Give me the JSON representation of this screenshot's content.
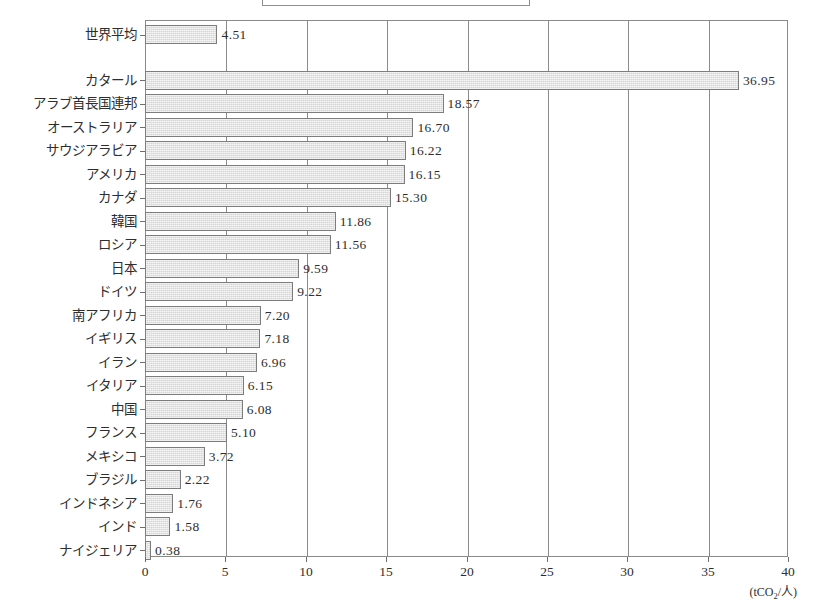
{
  "title_box": {
    "text": ""
  },
  "axis": {
    "unit_label_prefix": "(tCO",
    "unit_label_sub": "2",
    "unit_label_suffix": "/人)",
    "ticks": [
      "0",
      "5",
      "10",
      "15",
      "20",
      "25",
      "30",
      "35",
      "40"
    ]
  },
  "colors": {
    "bar_fill": "#d6d6d6",
    "bar_border": "#7d7d7d",
    "frame": "#8a8a8a",
    "text": "#2e2e2e",
    "background": "#ffffff"
  },
  "chart_data": {
    "type": "bar",
    "orientation": "horizontal",
    "title": "",
    "xlabel": "(tCO2/人)",
    "ylabel": "",
    "xlim": [
      0,
      40
    ],
    "xticks": [
      0,
      5,
      10,
      15,
      20,
      25,
      30,
      35,
      40
    ],
    "grid": true,
    "legend": "none",
    "categories": [
      "世界平均",
      "カタール",
      "アラブ首長国連邦",
      "オーストラリア",
      "サウジアラビア",
      "アメリカ",
      "カナダ",
      "韓国",
      "ロシア",
      "日本",
      "ドイツ",
      "南アフリカ",
      "イギリス",
      "イラン",
      "イタリア",
      "中国",
      "フランス",
      "メキシコ",
      "ブラジル",
      "インドネシア",
      "インド",
      "ナイジェリア"
    ],
    "values": [
      4.51,
      36.95,
      18.57,
      16.7,
      16.22,
      16.15,
      15.3,
      11.86,
      11.56,
      9.59,
      9.22,
      7.2,
      7.18,
      6.96,
      6.15,
      6.08,
      5.1,
      3.72,
      2.22,
      1.76,
      1.58,
      0.38
    ],
    "value_labels": [
      "4.51",
      "36.95",
      "18.57",
      "16.70",
      "16.22",
      "16.15",
      "15.30",
      "11.86",
      "11.56",
      "9.59",
      "9.22",
      "7.20",
      "7.18",
      "6.96",
      "6.15",
      "6.08",
      "5.10",
      "3.72",
      "2.22",
      "1.76",
      "1.58",
      "0.38"
    ]
  }
}
